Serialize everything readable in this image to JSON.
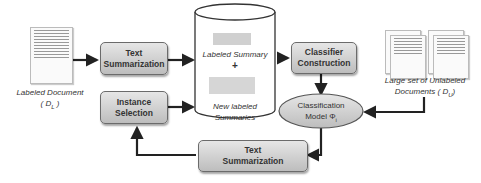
{
  "diagram": {
    "nodes": {
      "labeled_document": {
        "title": "Labeled Document",
        "symbol": "( D",
        "sub": "L",
        "close": " )"
      },
      "text_summarization_top": {
        "line1": "Text",
        "line2": "Summarization"
      },
      "instance_selection": {
        "line1": "Instance",
        "line2": "Selection"
      },
      "database": {
        "labeled_summary": "Labeled Summary",
        "plus": "+",
        "new_line1": "New labeled",
        "new_line2": "Summaries"
      },
      "classifier_construction": {
        "line1": "Classifier",
        "line2": "Construction"
      },
      "classification_model": {
        "line1": "Classification",
        "line2": "Model Φ",
        "sub": "i"
      },
      "unlabeled_documents": {
        "line1": "Large set of Unlabeled",
        "line2": "Documents ( D",
        "sub": "U",
        "close": ")"
      },
      "text_summarization_bottom": {
        "line1": "Text",
        "line2": "Summarization"
      }
    }
  }
}
